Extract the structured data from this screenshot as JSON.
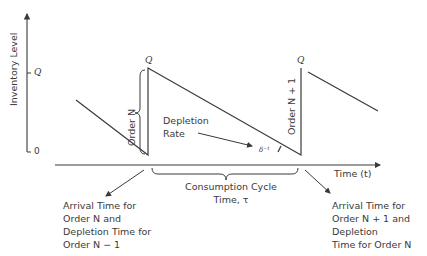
{
  "diagram": {
    "y_axis_label": "Inventory Level",
    "x_axis_label": "Time (t)",
    "y_ticks": {
      "top": "Q",
      "bottom": "0"
    },
    "peak_labels": [
      "Q",
      "Q"
    ],
    "order_n_label": "Order N",
    "order_n1_label": "Order N + 1",
    "depletion_rate_label": [
      "Depletion",
      "Rate"
    ],
    "slope_symbol": "δ⁻¹",
    "cycle_label": [
      "Consumption Cycle",
      "Time, τ"
    ],
    "left_annotation": [
      "Arrival Time for",
      "Order N and",
      "Depletion Time for",
      "Order N − 1"
    ],
    "right_annotation": [
      "Arrival Time for",
      "Order N + 1 and",
      "Depletion",
      "Time for Order N"
    ]
  },
  "colors": {
    "line": "#3a3a3a",
    "background": "#ffffff"
  }
}
